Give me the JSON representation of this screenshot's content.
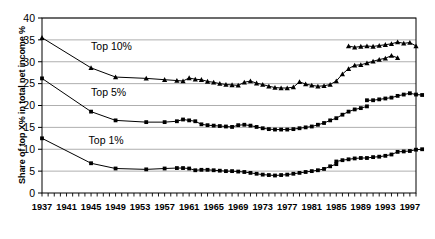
{
  "chart_data": {
    "type": "line",
    "title": "",
    "xlabel": "",
    "ylabel": "Share of top X% in total net income %",
    "ylim": [
      0,
      40
    ],
    "ytick_values": [
      0,
      5,
      10,
      15,
      20,
      25,
      30,
      35,
      40
    ],
    "ytick_labels": [
      "0",
      "5",
      "10",
      "15",
      "20",
      "25",
      "30",
      "35",
      "40"
    ],
    "xlim": [
      1937,
      1998
    ],
    "xtick_labels": [
      "1937",
      "1941",
      "1945",
      "1949",
      "1953",
      "1957",
      "1961",
      "1965",
      "1969",
      "1973",
      "1977",
      "1981",
      "1985",
      "1989",
      "1993",
      "1997"
    ],
    "xtick_years": [
      1937,
      1941,
      1945,
      1949,
      1953,
      1957,
      1961,
      1965,
      1969,
      1973,
      1977,
      1981,
      1985,
      1989,
      1993,
      1997
    ],
    "minor_tick_interval": 1,
    "grid": "horizontal",
    "legend_position": "inline-annotations",
    "annotations": [
      {
        "text": "Top 10%",
        "x": 1945.0,
        "y": 32.6
      },
      {
        "text": "Top 5%",
        "x": 1945.0,
        "y": 22.2
      },
      {
        "text": "Top 1%",
        "x": 1944.6,
        "y": 11.3
      }
    ],
    "series": [
      {
        "name": "Top 10%",
        "marker": "triangle",
        "color": "#000000",
        "points": [
          {
            "x": 1937,
            "y": 35.5
          },
          {
            "x": 1945,
            "y": 28.6
          },
          {
            "x": 1949,
            "y": 26.5
          },
          {
            "x": 1954,
            "y": 26.2
          },
          {
            "x": 1957,
            "y": 25.9
          },
          {
            "x": 1959,
            "y": 25.7
          },
          {
            "x": 1960,
            "y": 25.6
          },
          {
            "x": 1961,
            "y": 26.3
          },
          {
            "x": 1962,
            "y": 26.0
          },
          {
            "x": 1963,
            "y": 25.9
          },
          {
            "x": 1964,
            "y": 25.5
          },
          {
            "x": 1965,
            "y": 25.3
          },
          {
            "x": 1966,
            "y": 25.0
          },
          {
            "x": 1967,
            "y": 24.8
          },
          {
            "x": 1968,
            "y": 24.7
          },
          {
            "x": 1969,
            "y": 24.6
          },
          {
            "x": 1970,
            "y": 25.3
          },
          {
            "x": 1971,
            "y": 25.6
          },
          {
            "x": 1972,
            "y": 25.1
          },
          {
            "x": 1973,
            "y": 24.8
          },
          {
            "x": 1974,
            "y": 24.4
          },
          {
            "x": 1975,
            "y": 24.1
          },
          {
            "x": 1976,
            "y": 24.0
          },
          {
            "x": 1977,
            "y": 24.0
          },
          {
            "x": 1978,
            "y": 24.2
          },
          {
            "x": 1979,
            "y": 25.4
          },
          {
            "x": 1980,
            "y": 24.9
          },
          {
            "x": 1981,
            "y": 24.6
          },
          {
            "x": 1982,
            "y": 24.4
          },
          {
            "x": 1983,
            "y": 24.5
          },
          {
            "x": 1984,
            "y": 24.8
          },
          {
            "x": 1985,
            "y": 25.6
          },
          {
            "x": 1986,
            "y": 27.2
          },
          {
            "x": 1987,
            "y": 28.4
          },
          {
            "x": 1988,
            "y": 29.2
          },
          {
            "x": 1989,
            "y": 29.3
          },
          {
            "x": 1990,
            "y": 29.7
          },
          {
            "x": 1991,
            "y": 30.1
          },
          {
            "x": 1992,
            "y": 30.5
          },
          {
            "x": 1993,
            "y": 30.8
          },
          {
            "x": 1994,
            "y": 31.4
          },
          {
            "x": 1995,
            "y": 30.9
          }
        ]
      },
      {
        "name": "Top 10% (series break)",
        "marker": "triangle",
        "color": "#000000",
        "points": [
          {
            "x": 1987,
            "y": 33.6
          },
          {
            "x": 1988,
            "y": 33.3
          },
          {
            "x": 1989,
            "y": 33.5
          },
          {
            "x": 1990,
            "y": 33.6
          },
          {
            "x": 1991,
            "y": 33.5
          },
          {
            "x": 1992,
            "y": 33.7
          },
          {
            "x": 1993,
            "y": 33.9
          },
          {
            "x": 1994,
            "y": 34.1
          },
          {
            "x": 1995,
            "y": 34.5
          },
          {
            "x": 1996,
            "y": 34.2
          },
          {
            "x": 1997,
            "y": 34.4
          },
          {
            "x": 1998,
            "y": 33.6
          }
        ]
      },
      {
        "name": "Top 5%",
        "marker": "square",
        "color": "#000000",
        "points": [
          {
            "x": 1937,
            "y": 26.2
          },
          {
            "x": 1945,
            "y": 18.6
          },
          {
            "x": 1949,
            "y": 16.6
          },
          {
            "x": 1954,
            "y": 16.2
          },
          {
            "x": 1957,
            "y": 16.2
          },
          {
            "x": 1959,
            "y": 16.4
          },
          {
            "x": 1960,
            "y": 16.8
          },
          {
            "x": 1961,
            "y": 16.6
          },
          {
            "x": 1962,
            "y": 16.4
          },
          {
            "x": 1963,
            "y": 15.7
          },
          {
            "x": 1964,
            "y": 15.5
          },
          {
            "x": 1965,
            "y": 15.4
          },
          {
            "x": 1966,
            "y": 15.3
          },
          {
            "x": 1967,
            "y": 15.2
          },
          {
            "x": 1968,
            "y": 15.1
          },
          {
            "x": 1969,
            "y": 15.5
          },
          {
            "x": 1970,
            "y": 15.6
          },
          {
            "x": 1971,
            "y": 15.4
          },
          {
            "x": 1972,
            "y": 15.1
          },
          {
            "x": 1973,
            "y": 14.8
          },
          {
            "x": 1974,
            "y": 14.6
          },
          {
            "x": 1975,
            "y": 14.5
          },
          {
            "x": 1976,
            "y": 14.5
          },
          {
            "x": 1977,
            "y": 14.5
          },
          {
            "x": 1978,
            "y": 14.6
          },
          {
            "x": 1979,
            "y": 14.8
          },
          {
            "x": 1980,
            "y": 15.0
          },
          {
            "x": 1981,
            "y": 15.2
          },
          {
            "x": 1982,
            "y": 15.6
          },
          {
            "x": 1983,
            "y": 16.0
          },
          {
            "x": 1984,
            "y": 16.6
          },
          {
            "x": 1985,
            "y": 17.1
          },
          {
            "x": 1986,
            "y": 17.9
          },
          {
            "x": 1987,
            "y": 18.6
          },
          {
            "x": 1988,
            "y": 19.1
          },
          {
            "x": 1989,
            "y": 19.4
          },
          {
            "x": 1990,
            "y": 19.8
          }
        ]
      },
      {
        "name": "Top 5% (series break)",
        "marker": "square",
        "color": "#000000",
        "points": [
          {
            "x": 1990,
            "y": 21.2
          },
          {
            "x": 1991,
            "y": 21.2
          },
          {
            "x": 1992,
            "y": 21.4
          },
          {
            "x": 1993,
            "y": 21.6
          },
          {
            "x": 1994,
            "y": 21.8
          },
          {
            "x": 1995,
            "y": 22.2
          },
          {
            "x": 1996,
            "y": 22.5
          },
          {
            "x": 1997,
            "y": 22.8
          },
          {
            "x": 1998,
            "y": 22.5
          },
          {
            "x": 1999,
            "y": 22.4
          }
        ]
      },
      {
        "name": "Top 1%",
        "marker": "square",
        "color": "#000000",
        "points": [
          {
            "x": 1937,
            "y": 12.5
          },
          {
            "x": 1945,
            "y": 6.8
          },
          {
            "x": 1949,
            "y": 5.6
          },
          {
            "x": 1954,
            "y": 5.4
          },
          {
            "x": 1957,
            "y": 5.6
          },
          {
            "x": 1959,
            "y": 5.7
          },
          {
            "x": 1960,
            "y": 5.7
          },
          {
            "x": 1961,
            "y": 5.6
          },
          {
            "x": 1962,
            "y": 5.2
          },
          {
            "x": 1963,
            "y": 5.3
          },
          {
            "x": 1964,
            "y": 5.3
          },
          {
            "x": 1965,
            "y": 5.2
          },
          {
            "x": 1966,
            "y": 5.1
          },
          {
            "x": 1967,
            "y": 5.0
          },
          {
            "x": 1968,
            "y": 5.0
          },
          {
            "x": 1969,
            "y": 4.9
          },
          {
            "x": 1970,
            "y": 4.8
          },
          {
            "x": 1971,
            "y": 4.6
          },
          {
            "x": 1972,
            "y": 4.4
          },
          {
            "x": 1973,
            "y": 4.2
          },
          {
            "x": 1974,
            "y": 4.1
          },
          {
            "x": 1975,
            "y": 4.0
          },
          {
            "x": 1976,
            "y": 4.1
          },
          {
            "x": 1977,
            "y": 4.2
          },
          {
            "x": 1978,
            "y": 4.4
          },
          {
            "x": 1979,
            "y": 4.6
          },
          {
            "x": 1980,
            "y": 4.8
          },
          {
            "x": 1981,
            "y": 5.0
          },
          {
            "x": 1982,
            "y": 5.2
          },
          {
            "x": 1983,
            "y": 5.5
          },
          {
            "x": 1984,
            "y": 6.1
          },
          {
            "x": 1985,
            "y": 6.6
          }
        ]
      },
      {
        "name": "Top 1% (series break)",
        "marker": "square",
        "color": "#000000",
        "points": [
          {
            "x": 1985,
            "y": 7.2
          },
          {
            "x": 1986,
            "y": 7.5
          },
          {
            "x": 1987,
            "y": 7.7
          },
          {
            "x": 1988,
            "y": 7.9
          },
          {
            "x": 1989,
            "y": 8.0
          },
          {
            "x": 1990,
            "y": 8.0
          },
          {
            "x": 1991,
            "y": 8.2
          },
          {
            "x": 1992,
            "y": 8.3
          },
          {
            "x": 1993,
            "y": 8.5
          },
          {
            "x": 1994,
            "y": 8.8
          },
          {
            "x": 1995,
            "y": 9.4
          },
          {
            "x": 1996,
            "y": 9.5
          },
          {
            "x": 1997,
            "y": 9.6
          },
          {
            "x": 1998,
            "y": 9.9
          },
          {
            "x": 1999,
            "y": 10.0
          }
        ]
      }
    ]
  }
}
